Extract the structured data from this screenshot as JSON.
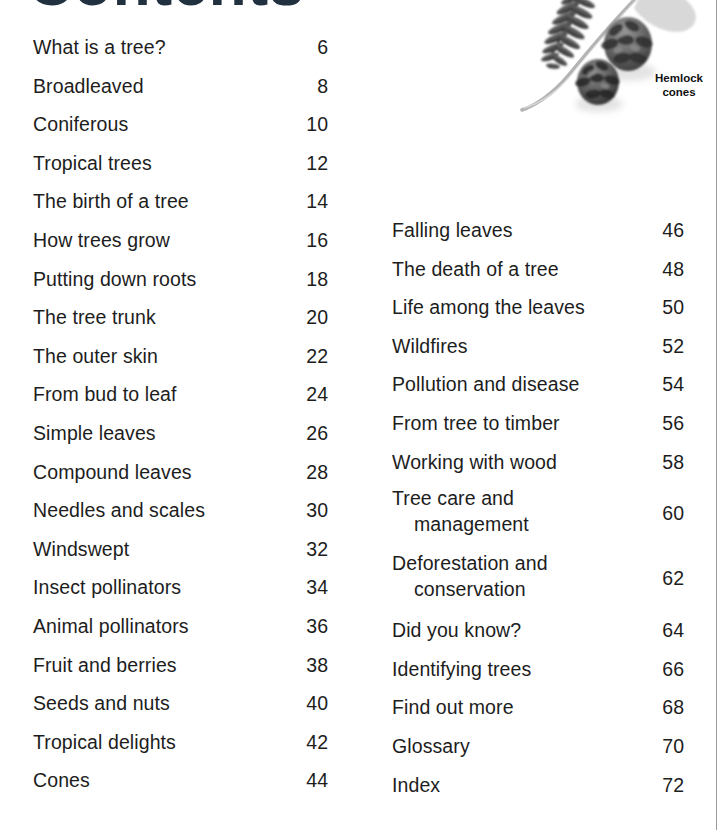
{
  "page": {
    "title": "Contents",
    "background_color": "#ffffff",
    "text_color": "#1d1d1d"
  },
  "illustration": {
    "name": "hemlock-branch-and-cones-photo",
    "caption_line1": "Hemlock",
    "caption_line2": "cones",
    "items": [
      "conifer-branch",
      "hemlock-cone-large",
      "hemlock-cone-small"
    ]
  },
  "contents": {
    "left_column": [
      {
        "label": "What is a tree?",
        "page": "6"
      },
      {
        "label": "Broadleaved",
        "page": "8"
      },
      {
        "label": "Coniferous",
        "page": "10"
      },
      {
        "label": "Tropical trees",
        "page": "12"
      },
      {
        "label": "The birth of a tree",
        "page": "14"
      },
      {
        "label": "How trees grow",
        "page": "16"
      },
      {
        "label": "Putting down roots",
        "page": "18"
      },
      {
        "label": "The tree trunk",
        "page": "20"
      },
      {
        "label": "The outer skin",
        "page": "22"
      },
      {
        "label": "From bud to leaf",
        "page": "24"
      },
      {
        "label": "Simple leaves",
        "page": "26"
      },
      {
        "label": "Compound leaves",
        "page": "28"
      },
      {
        "label": "Needles and scales",
        "page": "30"
      },
      {
        "label": "Windswept",
        "page": "32"
      },
      {
        "label": "Insect pollinators",
        "page": "34"
      },
      {
        "label": "Animal pollinators",
        "page": "36"
      },
      {
        "label": "Fruit and berries",
        "page": "38"
      },
      {
        "label": "Seeds and nuts",
        "page": "40"
      },
      {
        "label": "Tropical delights",
        "page": "42"
      },
      {
        "label": "Cones",
        "page": "44"
      }
    ],
    "right_column": [
      {
        "label": "Falling leaves",
        "page": "46"
      },
      {
        "label": "The death of a tree",
        "page": "48"
      },
      {
        "label": "Life among the leaves",
        "page": "50"
      },
      {
        "label": "Wildfires",
        "page": "52"
      },
      {
        "label": "Pollution and disease",
        "page": "54"
      },
      {
        "label": "From tree to timber",
        "page": "56"
      },
      {
        "label": "Working with wood",
        "page": "58"
      },
      {
        "label": "Tree care and",
        "label2": "management",
        "page": "60"
      },
      {
        "label": "Deforestation and",
        "label2": "conservation",
        "page": "62"
      },
      {
        "label": "Did you know?",
        "page": "64"
      },
      {
        "label": "Identifying trees",
        "page": "66"
      },
      {
        "label": "Find out more",
        "page": "68"
      },
      {
        "label": "Glossary",
        "page": "70"
      },
      {
        "label": "Index",
        "page": "72"
      }
    ]
  }
}
